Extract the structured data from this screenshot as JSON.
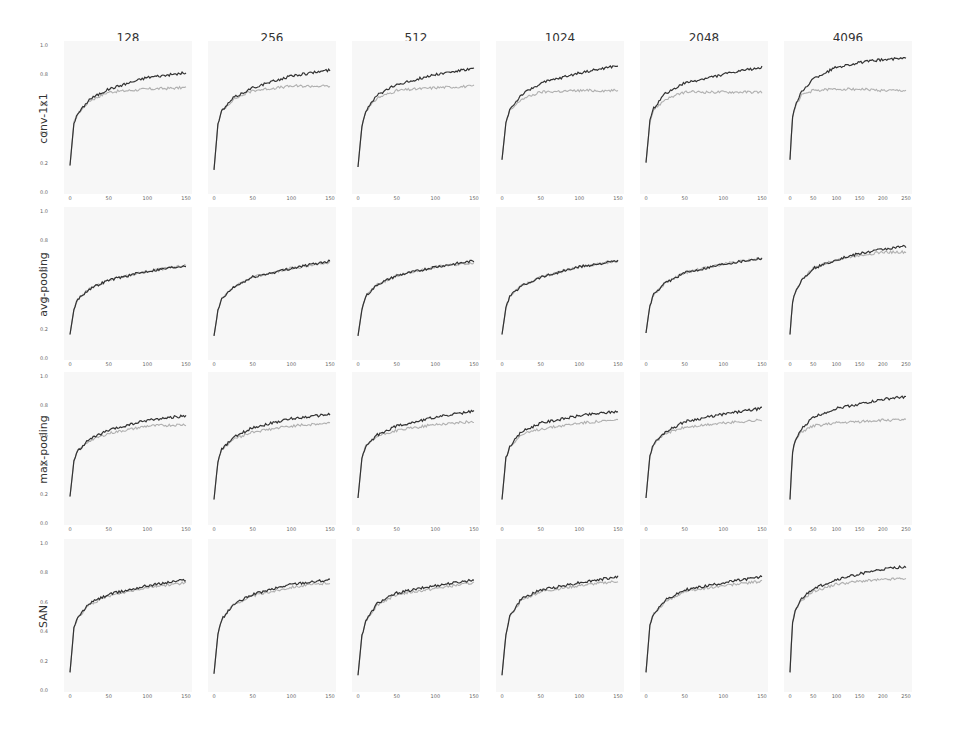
{
  "figure": {
    "columns": [
      "128",
      "256",
      "512",
      "1024",
      "2048",
      "4096"
    ],
    "rows": [
      "conv-1x1",
      "avg-pooling",
      "max-pooling",
      "SAN"
    ],
    "y_ticks": [
      "0.0",
      "0.2",
      "0.4",
      "0.6",
      "0.8",
      "1.0"
    ],
    "x_ticks_150": [
      "0",
      "50",
      "100",
      "150"
    ],
    "x_ticks_250": [
      "0",
      "50",
      "100",
      "150",
      "200",
      "250"
    ],
    "colors": {
      "train": "#333333",
      "test": "#b0b0b0",
      "panel_bg": "#f7f7f7"
    }
  },
  "chart_data": {
    "type": "line",
    "title": "",
    "layout": "grid 4 rows x 6 columns",
    "xlabel": "epoch",
    "ylabel": "accuracy",
    "ylim": [
      0.0,
      1.0
    ],
    "grid": false,
    "series_legend": [
      "train (dark)",
      "test (light)"
    ],
    "panels": [
      {
        "row": "conv-1x1",
        "col": "128",
        "xlim": [
          0,
          150
        ],
        "train": {
          "x": [
            0,
            5,
            10,
            25,
            50,
            100,
            150
          ],
          "y": [
            0.18,
            0.47,
            0.53,
            0.63,
            0.7,
            0.78,
            0.81
          ]
        },
        "test": {
          "x": [
            0,
            5,
            10,
            25,
            50,
            100,
            150
          ],
          "y": [
            0.18,
            0.47,
            0.53,
            0.62,
            0.68,
            0.7,
            0.71
          ]
        }
      },
      {
        "row": "conv-1x1",
        "col": "256",
        "xlim": [
          0,
          150
        ],
        "train": {
          "x": [
            0,
            5,
            10,
            25,
            50,
            100,
            150
          ],
          "y": [
            0.15,
            0.46,
            0.55,
            0.64,
            0.71,
            0.79,
            0.83
          ]
        },
        "test": {
          "x": [
            0,
            5,
            10,
            25,
            50,
            100,
            150
          ],
          "y": [
            0.15,
            0.46,
            0.55,
            0.63,
            0.69,
            0.72,
            0.72
          ]
        }
      },
      {
        "row": "conv-1x1",
        "col": "512",
        "xlim": [
          0,
          150
        ],
        "train": {
          "x": [
            0,
            5,
            10,
            25,
            50,
            100,
            150
          ],
          "y": [
            0.17,
            0.45,
            0.55,
            0.66,
            0.73,
            0.8,
            0.84
          ]
        },
        "test": {
          "x": [
            0,
            5,
            10,
            25,
            50,
            100,
            150
          ],
          "y": [
            0.17,
            0.45,
            0.55,
            0.64,
            0.69,
            0.71,
            0.72
          ]
        }
      },
      {
        "row": "conv-1x1",
        "col": "1024",
        "xlim": [
          0,
          150
        ],
        "train": {
          "x": [
            0,
            5,
            10,
            25,
            50,
            100,
            150
          ],
          "y": [
            0.22,
            0.47,
            0.56,
            0.66,
            0.74,
            0.81,
            0.86
          ]
        },
        "test": {
          "x": [
            0,
            5,
            10,
            25,
            50,
            100,
            150
          ],
          "y": [
            0.22,
            0.47,
            0.55,
            0.63,
            0.68,
            0.69,
            0.69
          ]
        }
      },
      {
        "row": "conv-1x1",
        "col": "2048",
        "xlim": [
          0,
          150
        ],
        "train": {
          "x": [
            0,
            5,
            10,
            25,
            50,
            100,
            150
          ],
          "y": [
            0.2,
            0.48,
            0.57,
            0.67,
            0.74,
            0.8,
            0.85
          ]
        },
        "test": {
          "x": [
            0,
            5,
            10,
            25,
            50,
            100,
            150
          ],
          "y": [
            0.2,
            0.48,
            0.56,
            0.63,
            0.68,
            0.68,
            0.68
          ]
        }
      },
      {
        "row": "conv-1x1",
        "col": "4096",
        "xlim": [
          0,
          250
        ],
        "train": {
          "x": [
            0,
            5,
            10,
            25,
            50,
            100,
            150,
            200,
            250
          ],
          "y": [
            0.22,
            0.5,
            0.58,
            0.68,
            0.77,
            0.85,
            0.88,
            0.9,
            0.91
          ]
        },
        "test": {
          "x": [
            0,
            5,
            10,
            25,
            50,
            100,
            150,
            200,
            250
          ],
          "y": [
            0.22,
            0.5,
            0.57,
            0.66,
            0.69,
            0.7,
            0.7,
            0.69,
            0.69
          ]
        }
      },
      {
        "row": "avg-pooling",
        "col": "128",
        "xlim": [
          0,
          150
        ],
        "train": {
          "x": [
            0,
            5,
            10,
            25,
            50,
            100,
            150
          ],
          "y": [
            0.16,
            0.33,
            0.4,
            0.47,
            0.53,
            0.59,
            0.63
          ]
        },
        "test": {
          "x": [
            0,
            5,
            10,
            25,
            50,
            100,
            150
          ],
          "y": [
            0.16,
            0.33,
            0.4,
            0.47,
            0.53,
            0.59,
            0.63
          ]
        }
      },
      {
        "row": "avg-pooling",
        "col": "256",
        "xlim": [
          0,
          150
        ],
        "train": {
          "x": [
            0,
            5,
            10,
            25,
            50,
            100,
            150
          ],
          "y": [
            0.15,
            0.32,
            0.4,
            0.48,
            0.55,
            0.61,
            0.66
          ]
        },
        "test": {
          "x": [
            0,
            5,
            10,
            25,
            50,
            100,
            150
          ],
          "y": [
            0.15,
            0.32,
            0.4,
            0.48,
            0.55,
            0.61,
            0.65
          ]
        }
      },
      {
        "row": "avg-pooling",
        "col": "512",
        "xlim": [
          0,
          150
        ],
        "train": {
          "x": [
            0,
            5,
            10,
            25,
            50,
            100,
            150
          ],
          "y": [
            0.15,
            0.33,
            0.42,
            0.5,
            0.56,
            0.62,
            0.66
          ]
        },
        "test": {
          "x": [
            0,
            5,
            10,
            25,
            50,
            100,
            150
          ],
          "y": [
            0.15,
            0.33,
            0.42,
            0.5,
            0.56,
            0.62,
            0.65
          ]
        }
      },
      {
        "row": "avg-pooling",
        "col": "1024",
        "xlim": [
          0,
          150
        ],
        "train": {
          "x": [
            0,
            5,
            10,
            25,
            50,
            100,
            150
          ],
          "y": [
            0.16,
            0.34,
            0.42,
            0.49,
            0.55,
            0.62,
            0.66
          ]
        },
        "test": {
          "x": [
            0,
            5,
            10,
            25,
            50,
            100,
            150
          ],
          "y": [
            0.16,
            0.34,
            0.42,
            0.49,
            0.55,
            0.62,
            0.66
          ]
        }
      },
      {
        "row": "avg-pooling",
        "col": "2048",
        "xlim": [
          0,
          150
        ],
        "train": {
          "x": [
            0,
            5,
            10,
            25,
            50,
            100,
            150
          ],
          "y": [
            0.17,
            0.36,
            0.43,
            0.51,
            0.58,
            0.64,
            0.68
          ]
        },
        "test": {
          "x": [
            0,
            5,
            10,
            25,
            50,
            100,
            150
          ],
          "y": [
            0.17,
            0.36,
            0.43,
            0.51,
            0.58,
            0.64,
            0.68
          ]
        }
      },
      {
        "row": "avg-pooling",
        "col": "4096",
        "xlim": [
          0,
          250
        ],
        "train": {
          "x": [
            0,
            5,
            10,
            25,
            50,
            100,
            150,
            200,
            250
          ],
          "y": [
            0.16,
            0.37,
            0.44,
            0.53,
            0.61,
            0.67,
            0.71,
            0.74,
            0.76
          ]
        },
        "test": {
          "x": [
            0,
            5,
            10,
            25,
            50,
            100,
            150,
            200,
            250
          ],
          "y": [
            0.16,
            0.37,
            0.44,
            0.53,
            0.61,
            0.67,
            0.7,
            0.72,
            0.72
          ]
        }
      },
      {
        "row": "max-pooling",
        "col": "128",
        "xlim": [
          0,
          150
        ],
        "train": {
          "x": [
            0,
            5,
            10,
            25,
            50,
            100,
            150
          ],
          "y": [
            0.18,
            0.42,
            0.49,
            0.57,
            0.63,
            0.7,
            0.73
          ]
        },
        "test": {
          "x": [
            0,
            5,
            10,
            25,
            50,
            100,
            150
          ],
          "y": [
            0.18,
            0.42,
            0.49,
            0.56,
            0.61,
            0.66,
            0.67
          ]
        }
      },
      {
        "row": "max-pooling",
        "col": "256",
        "xlim": [
          0,
          150
        ],
        "train": {
          "x": [
            0,
            5,
            10,
            25,
            50,
            100,
            150
          ],
          "y": [
            0.16,
            0.42,
            0.5,
            0.58,
            0.65,
            0.71,
            0.74
          ]
        },
        "test": {
          "x": [
            0,
            5,
            10,
            25,
            50,
            100,
            150
          ],
          "y": [
            0.16,
            0.42,
            0.5,
            0.57,
            0.62,
            0.66,
            0.68
          ]
        }
      },
      {
        "row": "max-pooling",
        "col": "512",
        "xlim": [
          0,
          150
        ],
        "train": {
          "x": [
            0,
            5,
            10,
            25,
            50,
            100,
            150
          ],
          "y": [
            0.17,
            0.44,
            0.52,
            0.6,
            0.66,
            0.72,
            0.76
          ]
        },
        "test": {
          "x": [
            0,
            5,
            10,
            25,
            50,
            100,
            150
          ],
          "y": [
            0.17,
            0.44,
            0.52,
            0.59,
            0.63,
            0.67,
            0.69
          ]
        }
      },
      {
        "row": "max-pooling",
        "col": "1024",
        "xlim": [
          0,
          150
        ],
        "train": {
          "x": [
            0,
            5,
            10,
            25,
            50,
            100,
            150
          ],
          "y": [
            0.16,
            0.44,
            0.52,
            0.62,
            0.68,
            0.73,
            0.76
          ]
        },
        "test": {
          "x": [
            0,
            5,
            10,
            25,
            50,
            100,
            150
          ],
          "y": [
            0.16,
            0.44,
            0.52,
            0.6,
            0.64,
            0.68,
            0.7
          ]
        }
      },
      {
        "row": "max-pooling",
        "col": "2048",
        "xlim": [
          0,
          150
        ],
        "train": {
          "x": [
            0,
            5,
            10,
            25,
            50,
            100,
            150
          ],
          "y": [
            0.17,
            0.46,
            0.54,
            0.62,
            0.69,
            0.74,
            0.78
          ]
        },
        "test": {
          "x": [
            0,
            5,
            10,
            25,
            50,
            100,
            150
          ],
          "y": [
            0.17,
            0.46,
            0.54,
            0.61,
            0.65,
            0.68,
            0.7
          ]
        }
      },
      {
        "row": "max-pooling",
        "col": "4096",
        "xlim": [
          0,
          250
        ],
        "train": {
          "x": [
            0,
            5,
            10,
            25,
            50,
            100,
            150,
            200,
            250
          ],
          "y": [
            0.16,
            0.47,
            0.55,
            0.64,
            0.72,
            0.78,
            0.81,
            0.84,
            0.86
          ]
        },
        "test": {
          "x": [
            0,
            5,
            10,
            25,
            50,
            100,
            150,
            200,
            250
          ],
          "y": [
            0.16,
            0.47,
            0.55,
            0.62,
            0.66,
            0.68,
            0.69,
            0.7,
            0.7
          ]
        }
      },
      {
        "row": "SAN",
        "col": "128",
        "xlim": [
          0,
          150
        ],
        "train": {
          "x": [
            0,
            5,
            10,
            25,
            50,
            100,
            150
          ],
          "y": [
            0.12,
            0.42,
            0.49,
            0.59,
            0.65,
            0.71,
            0.75
          ]
        },
        "test": {
          "x": [
            0,
            5,
            10,
            25,
            50,
            100,
            150
          ],
          "y": [
            0.12,
            0.42,
            0.49,
            0.58,
            0.64,
            0.7,
            0.73
          ]
        }
      },
      {
        "row": "SAN",
        "col": "256",
        "xlim": [
          0,
          150
        ],
        "train": {
          "x": [
            0,
            5,
            10,
            25,
            50,
            100,
            150
          ],
          "y": [
            0.11,
            0.38,
            0.48,
            0.58,
            0.65,
            0.72,
            0.75
          ]
        },
        "test": {
          "x": [
            0,
            5,
            10,
            25,
            50,
            100,
            150
          ],
          "y": [
            0.11,
            0.38,
            0.48,
            0.58,
            0.64,
            0.7,
            0.73
          ]
        }
      },
      {
        "row": "SAN",
        "col": "512",
        "xlim": [
          0,
          150
        ],
        "train": {
          "x": [
            0,
            5,
            10,
            25,
            50,
            100,
            150
          ],
          "y": [
            0.1,
            0.37,
            0.47,
            0.59,
            0.66,
            0.71,
            0.75
          ]
        },
        "test": {
          "x": [
            0,
            5,
            10,
            25,
            50,
            100,
            150
          ],
          "y": [
            0.1,
            0.37,
            0.47,
            0.58,
            0.65,
            0.69,
            0.73
          ]
        }
      },
      {
        "row": "SAN",
        "col": "1024",
        "xlim": [
          0,
          150
        ],
        "train": {
          "x": [
            0,
            5,
            10,
            25,
            50,
            100,
            150
          ],
          "y": [
            0.1,
            0.38,
            0.5,
            0.62,
            0.68,
            0.73,
            0.77
          ]
        },
        "test": {
          "x": [
            0,
            5,
            10,
            25,
            50,
            100,
            150
          ],
          "y": [
            0.1,
            0.38,
            0.5,
            0.61,
            0.67,
            0.71,
            0.74
          ]
        }
      },
      {
        "row": "SAN",
        "col": "2048",
        "xlim": [
          0,
          150
        ],
        "train": {
          "x": [
            0,
            5,
            10,
            25,
            50,
            100,
            150
          ],
          "y": [
            0.12,
            0.44,
            0.52,
            0.61,
            0.68,
            0.73,
            0.77
          ]
        },
        "test": {
          "x": [
            0,
            5,
            10,
            25,
            50,
            100,
            150
          ],
          "y": [
            0.12,
            0.44,
            0.52,
            0.6,
            0.67,
            0.71,
            0.74
          ]
        }
      },
      {
        "row": "SAN",
        "col": "4096",
        "xlim": [
          0,
          250
        ],
        "train": {
          "x": [
            0,
            5,
            10,
            25,
            50,
            100,
            150,
            200,
            250
          ],
          "y": [
            0.12,
            0.45,
            0.53,
            0.62,
            0.69,
            0.75,
            0.79,
            0.82,
            0.84
          ]
        },
        "test": {
          "x": [
            0,
            5,
            10,
            25,
            50,
            100,
            150,
            200,
            250
          ],
          "y": [
            0.12,
            0.45,
            0.53,
            0.61,
            0.67,
            0.72,
            0.74,
            0.75,
            0.76
          ]
        }
      }
    ]
  }
}
